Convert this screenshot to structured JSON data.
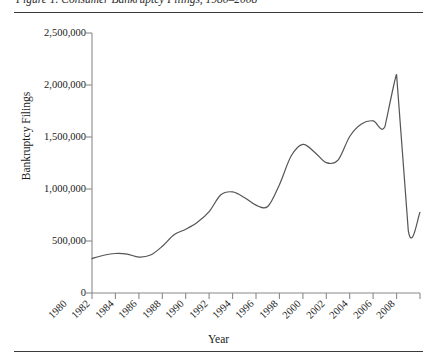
{
  "figure": {
    "caption": "Figure 1. Consumer Bankruptcy Filings, 1980–2008",
    "top_rule": "horizontal-rule",
    "bottom_rule": "horizontal-rule"
  },
  "chart_data": {
    "type": "line",
    "title": "",
    "xlabel": "Year",
    "ylabel": "Bankruptcy Filings",
    "xlim": [
      1980,
      2008
    ],
    "ylim": [
      0,
      2500000
    ],
    "grid": false,
    "legend": "none",
    "line_color": "#555555",
    "xticklabels": [
      "1980",
      "1982",
      "1984",
      "1986",
      "1988",
      "1990",
      "1992",
      "1994",
      "1996",
      "1998",
      "2000",
      "2002",
      "2004",
      "2006",
      "2008"
    ],
    "xtickvalues": [
      1980,
      1982,
      1984,
      1986,
      1988,
      1990,
      1992,
      1994,
      1996,
      1998,
      2000,
      2002,
      2004,
      2006,
      2008
    ],
    "yticklabels": [
      "0",
      "500,000",
      "1,000,000",
      "1,500,000",
      "2,000,000",
      "2,500,000"
    ],
    "ytickvalues": [
      0,
      500000,
      1000000,
      1500000,
      2000000,
      2500000
    ],
    "x": [
      1980,
      1981,
      1982,
      1983,
      1984,
      1985,
      1986,
      1987,
      1988,
      1989,
      1990,
      1991,
      1992,
      1993,
      1994,
      1995,
      1996,
      1997,
      1998,
      1999,
      2000,
      2001,
      2002,
      2003,
      2004,
      2005,
      2006,
      2007,
      2008
    ],
    "values": [
      331000,
      363000,
      380000,
      374000,
      345000,
      365000,
      449000,
      561000,
      613000,
      680000,
      783000,
      944000,
      972000,
      919000,
      845000,
      832000,
      1042000,
      1317000,
      1429000,
      1354000,
      1253000,
      1277000,
      1505000,
      1625000,
      1655000,
      1598000,
      2100000,
      600000,
      775000
    ]
  }
}
